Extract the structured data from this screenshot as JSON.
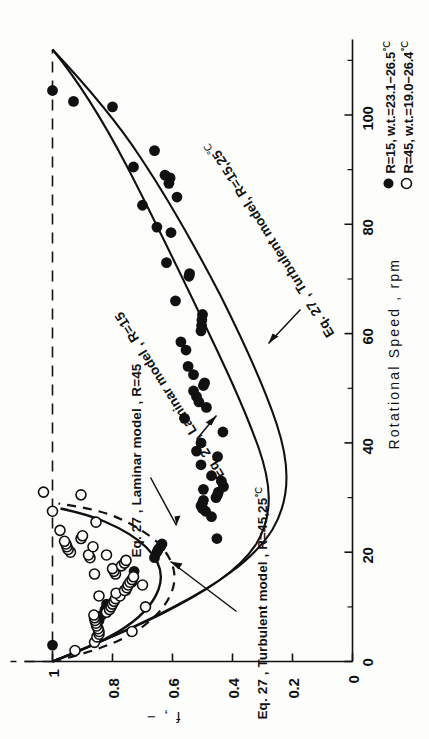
{
  "figure": {
    "kind": "scientific-plot",
    "background": "#fdfdfb",
    "ink": "#111111",
    "rotation_note": "figure printed rotated 90 degrees counter-clockwise on the page"
  },
  "axes": {
    "x": {
      "title": "Rotational Speed , rpm",
      "ticks": [
        "0",
        "20",
        "40",
        "60",
        "80",
        "100"
      ],
      "tick_values": [
        0,
        20,
        40,
        60,
        80,
        100
      ],
      "minor_tick_values": [
        10,
        30,
        50,
        70,
        90,
        110
      ],
      "range": [
        0,
        112
      ]
    },
    "y": {
      "title": "f , −",
      "ticks": [
        "0",
        "0.2",
        "0.4",
        "0.6",
        "0.8",
        "1"
      ],
      "tick_values": [
        0,
        0.2,
        0.4,
        0.6,
        0.8,
        1.0
      ],
      "range": [
        0,
        1.08
      ]
    }
  },
  "legend": {
    "entries": [
      {
        "marker": "filled-circle",
        "label": "R=15, w.t.=23.1−26.5",
        "unit": "℃"
      },
      {
        "marker": "open-circle",
        "label": "R=45, w.t.=19.0−26.4",
        "unit": "℃"
      }
    ]
  },
  "annotations": [
    {
      "id": "ann-turb-45",
      "text": "Eq. 27 , Turbulent model , R=45,25",
      "unit": "℃"
    },
    {
      "id": "ann-lam-45",
      "text": "Eq. 27 , Laminar model , R=45",
      "unit": ""
    },
    {
      "id": "ann-lam-15",
      "text": "Eq. 27 , Laminar model , R=15",
      "unit": ""
    },
    {
      "id": "ann-turb-15",
      "text": "Eq. 27 , Turbulent model, R=15,25",
      "unit": "℃"
    },
    {
      "id": "ann-eq27-a",
      "text": "Eq. 27",
      "unit": ""
    },
    {
      "id": "ann-eq27-b",
      "text": "Eq. 27 ,",
      "unit": ""
    }
  ],
  "chart_data": {
    "type": "scatter",
    "title": "",
    "xlabel": "Rotational Speed , rpm",
    "ylabel": "f , −",
    "xlim": [
      0,
      112
    ],
    "ylim": [
      0,
      1.08
    ],
    "grid": false,
    "legend_position": "right-middle",
    "reference_lines": [
      {
        "name": "f = 1 dashed reference",
        "style": "dashed",
        "y": 1.0,
        "x_from": 0,
        "x_to": 112
      }
    ],
    "series": [
      {
        "name": "R=15, w.t.=23.1−26.5 ℃",
        "marker": "filled-circle",
        "points": [
          [
            3.0,
            1.0
          ],
          [
            7.5,
            0.845
          ],
          [
            8.5,
            0.835
          ],
          [
            9.5,
            0.825
          ],
          [
            10.5,
            0.82
          ],
          [
            13.0,
            0.755
          ],
          [
            14.5,
            0.735
          ],
          [
            16.5,
            0.728
          ],
          [
            19.0,
            0.66
          ],
          [
            20.0,
            0.652
          ],
          [
            20.5,
            0.648
          ],
          [
            21.0,
            0.64
          ],
          [
            21.5,
            0.635
          ],
          [
            22.5,
            0.452
          ],
          [
            26.5,
            0.47
          ],
          [
            27.5,
            0.49
          ],
          [
            28.0,
            0.5
          ],
          [
            28.5,
            0.505
          ],
          [
            29.0,
            0.5
          ],
          [
            29.5,
            0.497
          ],
          [
            30.0,
            0.455
          ],
          [
            30.5,
            0.45
          ],
          [
            31.0,
            0.447
          ],
          [
            31.5,
            0.497
          ],
          [
            32.0,
            0.43
          ],
          [
            33.0,
            0.437
          ],
          [
            34.0,
            0.47
          ],
          [
            36.0,
            0.505
          ],
          [
            37.5,
            0.45
          ],
          [
            38.5,
            0.52
          ],
          [
            40.0,
            0.505
          ],
          [
            42.0,
            0.432
          ],
          [
            44.5,
            0.56
          ],
          [
            46.5,
            0.487
          ],
          [
            47.5,
            0.512
          ],
          [
            48.5,
            0.52
          ],
          [
            49.5,
            0.53
          ],
          [
            50.5,
            0.497
          ],
          [
            51.0,
            0.493
          ],
          [
            52.5,
            0.53
          ],
          [
            54.0,
            0.548
          ],
          [
            57.0,
            0.555
          ],
          [
            58.5,
            0.572
          ],
          [
            60.5,
            0.505
          ],
          [
            61.5,
            0.503
          ],
          [
            62.5,
            0.502
          ],
          [
            63.5,
            0.5
          ],
          [
            66.0,
            0.59
          ],
          [
            70.5,
            0.545
          ],
          [
            71.0,
            0.543
          ],
          [
            73.0,
            0.62
          ],
          [
            78.5,
            0.605
          ],
          [
            79.5,
            0.652
          ],
          [
            83.5,
            0.7
          ],
          [
            85.0,
            0.585
          ],
          [
            87.5,
            0.612
          ],
          [
            88.5,
            0.608
          ],
          [
            89.0,
            0.625
          ],
          [
            90.5,
            0.73
          ],
          [
            93.5,
            0.66
          ],
          [
            101.5,
            0.8
          ],
          [
            102.5,
            0.93
          ],
          [
            104.5,
            1.0
          ]
        ]
      },
      {
        "name": "R=45, w.t.=19.0−26.4 ℃",
        "marker": "open-circle",
        "points": [
          [
            2.0,
            0.925
          ],
          [
            3.5,
            0.86
          ],
          [
            4.5,
            0.852
          ],
          [
            5.0,
            0.845
          ],
          [
            5.5,
            0.845
          ],
          [
            6.0,
            0.848
          ],
          [
            6.5,
            0.853
          ],
          [
            7.0,
            0.855
          ],
          [
            7.5,
            0.858
          ],
          [
            8.0,
            0.86
          ],
          [
            8.5,
            0.862
          ],
          [
            9.0,
            0.82
          ],
          [
            9.5,
            0.81
          ],
          [
            10.0,
            0.805
          ],
          [
            10.5,
            0.8
          ],
          [
            11.0,
            0.795
          ],
          [
            11.5,
            0.79
          ],
          [
            12.0,
            0.775
          ],
          [
            12.5,
            0.788
          ],
          [
            13.0,
            0.76
          ],
          [
            13.5,
            0.752
          ],
          [
            14.0,
            0.748
          ],
          [
            14.5,
            0.742
          ],
          [
            15.0,
            0.735
          ],
          [
            15.5,
            0.73
          ],
          [
            16.0,
            0.79
          ],
          [
            16.5,
            0.795
          ],
          [
            17.0,
            0.8
          ],
          [
            17.5,
            0.77
          ],
          [
            18.0,
            0.76
          ],
          [
            18.5,
            0.755
          ],
          [
            19.0,
            0.875
          ],
          [
            19.5,
            0.88
          ],
          [
            20.0,
            0.94
          ],
          [
            20.5,
            0.948
          ],
          [
            21.0,
            0.952
          ],
          [
            21.5,
            0.955
          ],
          [
            22.0,
            0.96
          ],
          [
            22.5,
            0.905
          ],
          [
            23.0,
            0.9
          ],
          [
            24.0,
            0.975
          ],
          [
            25.5,
            0.855
          ],
          [
            27.5,
            1.0
          ],
          [
            30.5,
            0.905
          ],
          [
            31.0,
            1.03
          ],
          [
            14.0,
            0.7
          ],
          [
            10.0,
            0.69
          ],
          [
            16.0,
            0.86
          ],
          [
            12.0,
            0.845
          ],
          [
            5.5,
            0.735
          ],
          [
            19.5,
            0.82
          ],
          [
            21.0,
            0.865
          ]
        ]
      }
    ],
    "model_curves": [
      {
        "name": "Eq. 27 , Laminar model , R=15",
        "style": "solid",
        "color": "#111111"
      },
      {
        "name": "Eq. 27 , Turbulent model, R=15,25℃",
        "style": "solid",
        "color": "#111111"
      },
      {
        "name": "Eq. 27 , Laminar model , R=45",
        "style": "solid",
        "color": "#111111"
      },
      {
        "name": "Eq. 27 , Turbulent model , R=45,25℃",
        "style": "dashed",
        "color": "#111111"
      }
    ]
  }
}
